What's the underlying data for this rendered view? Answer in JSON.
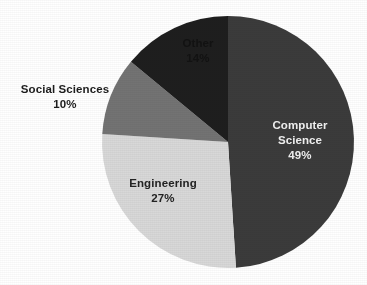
{
  "chart_data": {
    "type": "pie",
    "title": "",
    "subtitle": "",
    "xlabel": "",
    "ylabel": "",
    "grid": false,
    "legend_position": "none",
    "labels_inside_slices": true,
    "start_angle_deg": 0,
    "direction": "clockwise",
    "background_color": "#ffffff",
    "categories": [
      "Computer Science",
      "Engineering",
      "Social Sciences",
      "Other"
    ],
    "values": [
      49,
      27,
      10,
      14
    ],
    "value_suffix": "%",
    "slices": [
      {
        "name": "Computer Science",
        "value": 49,
        "label": "Computer Science",
        "label_line1": "Computer",
        "label_line2": "Science",
        "percent_label": "49%",
        "color": "#3b3b3b",
        "text_color": "#f2f2f2",
        "label_placement": "inside",
        "start_angle_deg": 0,
        "end_angle_deg": 176.4
      },
      {
        "name": "Engineering",
        "value": 27,
        "label": "Engineering",
        "label_line1": "Engineering",
        "label_line2": "",
        "percent_label": "27%",
        "color": "#d8d8d8",
        "text_color": "#232323",
        "label_placement": "inside",
        "start_angle_deg": 176.4,
        "end_angle_deg": 273.6
      },
      {
        "name": "Social Sciences",
        "value": 10,
        "label": "Social Sciences",
        "label_line1": "Social Sciences",
        "label_line2": "",
        "percent_label": "10%",
        "color": "#737373",
        "text_color": "#1d1d1d",
        "label_placement": "outside-left",
        "start_angle_deg": 273.6,
        "end_angle_deg": 309.6
      },
      {
        "name": "Other",
        "value": 14,
        "label": "Other",
        "label_line1": "Other",
        "label_line2": "",
        "percent_label": "14%",
        "color": "#1e1e1e",
        "text_color": "#121212",
        "label_placement": "inside",
        "start_angle_deg": 309.6,
        "end_angle_deg": 360
      }
    ],
    "geometry": {
      "center_x": 228,
      "center_y": 142,
      "radius": 126
    }
  }
}
